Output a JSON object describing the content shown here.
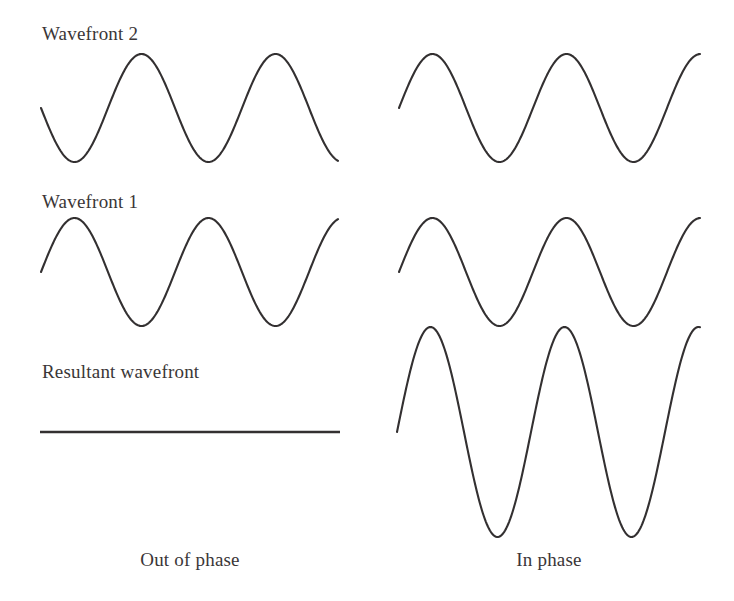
{
  "figure": {
    "background_color": "#ffffff",
    "stroke_color": "#333031",
    "text_color": "#3a3637"
  },
  "row_labels": [
    {
      "id": "wavefront-2",
      "text": "Wavefront 2",
      "x": 42,
      "y": 40
    },
    {
      "id": "wavefront-1",
      "text": "Wavefront 1",
      "x": 42,
      "y": 208
    },
    {
      "id": "resultant-wavefront",
      "text": "Resultant wavefront",
      "x": 42,
      "y": 378
    }
  ],
  "column_captions": [
    {
      "id": "out-of-phase",
      "text": "Out of phase",
      "x": 190,
      "y": 566
    },
    {
      "id": "in-phase",
      "text": "In phase",
      "x": 549,
      "y": 566
    }
  ],
  "chart_data": {
    "type": "line",
    "xlabel": "",
    "ylabel": "",
    "grid": false,
    "legend": "none",
    "columns": [
      {
        "name": "Out of phase",
        "caption": "Out of phase",
        "interference": "destructive",
        "phase_difference_degrees": 180,
        "series": [
          {
            "name": "Wavefront 2",
            "row": 1,
            "x_start": 41,
            "x_end": 338,
            "baseline_y": 108,
            "amplitude": 54,
            "wavelength": 134,
            "phase_degrees": 180,
            "cycles": 2.22,
            "shape": "sine"
          },
          {
            "name": "Wavefront 1",
            "row": 2,
            "x_start": 41,
            "x_end": 338,
            "baseline_y": 272,
            "amplitude": 54,
            "wavelength": 134,
            "phase_degrees": 0,
            "cycles": 2.22,
            "shape": "sine"
          },
          {
            "name": "Resultant wavefront",
            "row": 3,
            "x_start": 40,
            "x_end": 340,
            "baseline_y": 432,
            "amplitude": 0,
            "wavelength": 134,
            "phase_degrees": 0,
            "cycles": 2.22,
            "shape": "flat-line"
          }
        ]
      },
      {
        "name": "In phase",
        "caption": "In phase",
        "interference": "constructive",
        "phase_difference_degrees": 0,
        "series": [
          {
            "name": "Wavefront 2",
            "row": 1,
            "x_start": 399,
            "x_end": 700,
            "baseline_y": 108,
            "amplitude": 54,
            "wavelength": 134,
            "phase_degrees": 0,
            "cycles": 2.25,
            "shape": "sine"
          },
          {
            "name": "Wavefront 1",
            "row": 2,
            "x_start": 399,
            "x_end": 700,
            "baseline_y": 272,
            "amplitude": 54,
            "wavelength": 134,
            "phase_degrees": 0,
            "cycles": 2.25,
            "shape": "sine"
          },
          {
            "name": "Resultant wavefront",
            "row": 3,
            "x_start": 397,
            "x_end": 700,
            "baseline_y": 432,
            "amplitude": 105,
            "wavelength": 134,
            "phase_degrees": 0,
            "cycles": 2.25,
            "shape": "sine"
          }
        ]
      }
    ]
  }
}
